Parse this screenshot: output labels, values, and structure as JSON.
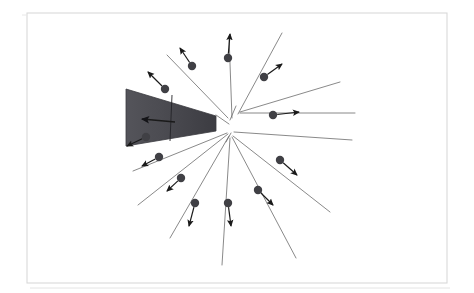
{
  "figure": {
    "title": "Radial Voronoi expansion diagram",
    "canvas": {
      "width": 474,
      "height": 293
    },
    "background_color": "#ffffff"
  },
  "frame": {
    "name": "outer-frame",
    "color": "#d9d9d9",
    "stroke_width": 1.1,
    "x": 27,
    "y": 13,
    "width": 420,
    "height": 270,
    "secondary_line": {
      "name": "frame-shadow-line",
      "color": "#e4e4e4",
      "x1": 30,
      "y1": 288,
      "x2": 450,
      "y2": 288
    },
    "left_tick": {
      "name": "frame-left-tick",
      "color": "#e8e8e8",
      "x1": 22,
      "y1": 15,
      "x2": 27,
      "y2": 15
    }
  },
  "geometry": {
    "center": {
      "x": 232,
      "y": 123
    },
    "second_node": {
      "x": 231,
      "y": 134
    },
    "third_node": {
      "x": 240,
      "y": 112
    }
  },
  "cell_lines": {
    "name": "voronoi-edges",
    "color": "#6b6b6b",
    "stroke_width": 0.8,
    "segments": [
      {
        "id": "edge-n",
        "x1": 232,
        "y1": 118,
        "x2": 229,
        "y2": 36
      },
      {
        "id": "edge-nne",
        "x1": 238,
        "y1": 114,
        "x2": 282,
        "y2": 33
      },
      {
        "id": "edge-nnw",
        "x1": 228,
        "y1": 118,
        "x2": 167,
        "y2": 55
      },
      {
        "id": "edge-ne",
        "x1": 240,
        "y1": 112,
        "x2": 340,
        "y2": 82
      },
      {
        "id": "edge-e-up",
        "x1": 240,
        "y1": 113,
        "x2": 355,
        "y2": 113
      },
      {
        "id": "edge-ese",
        "x1": 234,
        "y1": 132,
        "x2": 352,
        "y2": 140
      },
      {
        "id": "edge-se",
        "x1": 233,
        "y1": 136,
        "x2": 330,
        "y2": 212
      },
      {
        "id": "edge-sse",
        "x1": 232,
        "y1": 137,
        "x2": 296,
        "y2": 258
      },
      {
        "id": "edge-s",
        "x1": 230,
        "y1": 138,
        "x2": 222,
        "y2": 265
      },
      {
        "id": "edge-ssw",
        "x1": 229,
        "y1": 136,
        "x2": 170,
        "y2": 238
      },
      {
        "id": "edge-sw",
        "x1": 228,
        "y1": 134,
        "x2": 138,
        "y2": 205
      },
      {
        "id": "edge-wsw",
        "x1": 227,
        "y1": 133,
        "x2": 133,
        "y2": 171
      },
      {
        "id": "edge-inner-n",
        "x1": 230,
        "y1": 120,
        "x2": 236,
        "y2": 106
      },
      {
        "id": "edge-inner-w",
        "x1": 229,
        "y1": 124,
        "x2": 216,
        "y2": 115
      },
      {
        "id": "edge-inner-s",
        "x1": 231,
        "y1": 133,
        "x2": 226,
        "y2": 142
      }
    ]
  },
  "wedge": {
    "name": "shaded-sector",
    "fill_color": "#4a4a4f",
    "stroke_color": "#3a3a3f",
    "points": "126,89 216,116 216,131 126,146",
    "crack_line": {
      "x1": 172,
      "y1": 95,
      "x2": 170,
      "y2": 141,
      "color": "#242428"
    },
    "arrow": {
      "name": "wedge-velocity-arrow",
      "color": "#1a1a1a",
      "tail_x": 175,
      "tail_y": 122,
      "head_x": 142,
      "head_y": 119
    }
  },
  "seed_points": {
    "name": "seed-point-series",
    "dot_color": "#404045",
    "dot_radius": 4.2,
    "arrow_color": "#1a1a1a",
    "arrow_width": 1.2,
    "items": [
      {
        "id": "p1",
        "label": "NNW outer",
        "x": 165,
        "y": 89,
        "ax": 148,
        "ay": 72
      },
      {
        "id": "p2",
        "label": "N-left",
        "x": 192,
        "y": 66,
        "ax": 180,
        "ay": 48
      },
      {
        "id": "p3",
        "label": "N-top",
        "x": 228,
        "y": 58,
        "ax": 230,
        "ay": 34
      },
      {
        "id": "p4",
        "label": "NNE",
        "x": 264,
        "y": 77,
        "ax": 282,
        "ay": 64
      },
      {
        "id": "p5",
        "label": "E-upper",
        "x": 273,
        "y": 115,
        "ax": 299,
        "ay": 112
      },
      {
        "id": "p6",
        "label": "ESE",
        "x": 280,
        "y": 160,
        "ax": 297,
        "ay": 175
      },
      {
        "id": "p7",
        "label": "SE",
        "x": 258,
        "y": 190,
        "ax": 273,
        "ay": 205
      },
      {
        "id": "p8",
        "label": "S-right",
        "x": 228,
        "y": 203,
        "ax": 231,
        "ay": 226
      },
      {
        "id": "p9",
        "label": "S-left",
        "x": 195,
        "y": 203,
        "ax": 189,
        "ay": 226
      },
      {
        "id": "p10",
        "label": "SSW",
        "x": 181,
        "y": 178,
        "ax": 167,
        "ay": 191
      },
      {
        "id": "p11",
        "label": "SW",
        "x": 159,
        "y": 157,
        "ax": 142,
        "ay": 166
      },
      {
        "id": "p12",
        "label": "WSW",
        "x": 146,
        "y": 137,
        "ax": 127,
        "ay": 146
      }
    ]
  }
}
